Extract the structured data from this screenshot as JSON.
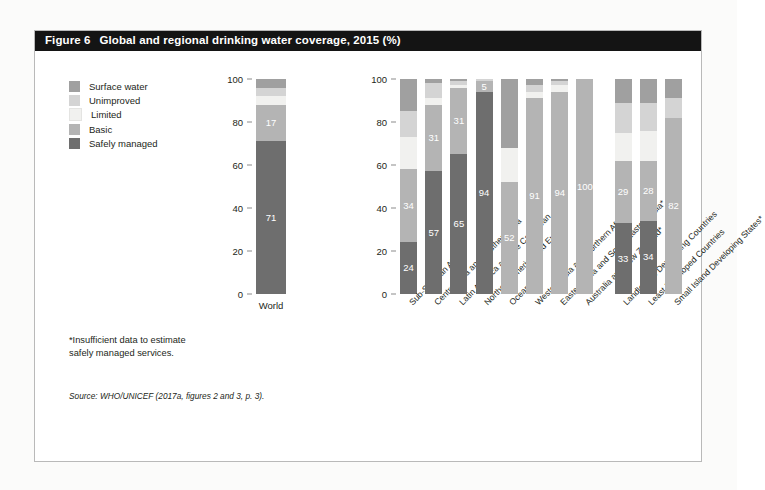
{
  "figure": {
    "number": "Figure 6",
    "title": "Global and regional drinking water coverage, 2015 (%)",
    "footnote_line1": "*Insufficient data to estimate",
    "footnote_line2": "safely managed services.",
    "source": "Source: WHO/UNICEF (2017a, figures 2 and 3, p. 3)."
  },
  "colors": {
    "title_bar": "#141414",
    "title_text": "#ffffff",
    "surface_water": "#a0a0a0",
    "unimproved": "#d4d4d4",
    "limited": "#f1f1ef",
    "basic": "#b4b4b4",
    "safely_managed": "#6e6e6e",
    "frame": "#b9b9b9",
    "text": "#231f20"
  },
  "legend": {
    "items": [
      {
        "label": "Surface water",
        "key": "surface_water",
        "color": "#a0a0a0"
      },
      {
        "label": "Unimproved",
        "key": "unimproved",
        "color": "#d4d4d4"
      },
      {
        "label": "Limited",
        "key": "limited",
        "color": "#f1f1ef"
      },
      {
        "label": "Basic",
        "key": "basic",
        "color": "#b4b4b4"
      },
      {
        "label": "Safely managed",
        "key": "safely_managed",
        "color": "#6e6e6e"
      }
    ]
  },
  "chart_data": {
    "type": "bar",
    "subtype": "stacked",
    "title": "Global and regional drinking water coverage, 2015 (%)",
    "xlabel": "",
    "ylabel": "",
    "ylim": [
      0,
      100
    ],
    "yticks": [
      0,
      20,
      40,
      60,
      80,
      100
    ],
    "grid": false,
    "legend_position": "top-left",
    "stack_order_bottom_to_top": [
      "Safely managed",
      "Basic",
      "Limited",
      "Unimproved",
      "Surface water"
    ],
    "series": [
      {
        "name": "Safely managed",
        "color": "#6e6e6e"
      },
      {
        "name": "Basic",
        "color": "#b4b4b4"
      },
      {
        "name": "Limited",
        "color": "#f1f1ef"
      },
      {
        "name": "Unimproved",
        "color": "#d4d4d4"
      },
      {
        "name": "Surface water",
        "color": "#a0a0a0"
      }
    ],
    "panels": [
      {
        "id": "global",
        "categories": [
          "World"
        ],
        "label_rotated": false,
        "bars": [
          {
            "category": "World",
            "segments": [
              {
                "series": "Safely managed",
                "value": 71,
                "label": "71"
              },
              {
                "series": "Basic",
                "value": 17,
                "label": "17"
              },
              {
                "series": "Limited",
                "value": 4,
                "label": ""
              },
              {
                "series": "Unimproved",
                "value": 4,
                "label": ""
              },
              {
                "series": "Surface water",
                "value": 4,
                "label": ""
              }
            ]
          }
        ]
      },
      {
        "id": "regional",
        "label_rotated": true,
        "categories": [
          "Sub-Saharan Africa",
          "Central Asia and Southern Asia",
          "Latin America and the Caribbean",
          "Northern America and Europe",
          "Oceania*",
          "Western Asia and Northern Africa*",
          "Eastern Asia and South-Eastern Asia*",
          "Australia and New Zealand*",
          "Landlocked Developing Countries",
          "Least Developed Countries",
          "Small Island Developing States*"
        ],
        "bars": [
          {
            "category": "Sub-Saharan Africa",
            "segments": [
              {
                "series": "Safely managed",
                "value": 24,
                "label": "24"
              },
              {
                "series": "Basic",
                "value": 34,
                "label": "34"
              },
              {
                "series": "Limited",
                "value": 15,
                "label": ""
              },
              {
                "series": "Unimproved",
                "value": 12,
                "label": ""
              },
              {
                "series": "Surface water",
                "value": 15,
                "label": ""
              }
            ]
          },
          {
            "category": "Central Asia and Southern Asia",
            "segments": [
              {
                "series": "Safely managed",
                "value": 57,
                "label": "57"
              },
              {
                "series": "Basic",
                "value": 31,
                "label": "31"
              },
              {
                "series": "Limited",
                "value": 3,
                "label": ""
              },
              {
                "series": "Unimproved",
                "value": 7,
                "label": ""
              },
              {
                "series": "Surface water",
                "value": 2,
                "label": ""
              }
            ]
          },
          {
            "category": "Latin America and the Caribbean",
            "segments": [
              {
                "series": "Safely managed",
                "value": 65,
                "label": "65"
              },
              {
                "series": "Basic",
                "value": 31,
                "label": "31"
              },
              {
                "series": "Limited",
                "value": 1,
                "label": ""
              },
              {
                "series": "Unimproved",
                "value": 2,
                "label": ""
              },
              {
                "series": "Surface water",
                "value": 1,
                "label": ""
              }
            ]
          },
          {
            "category": "Northern America and Europe",
            "segments": [
              {
                "series": "Safely managed",
                "value": 94,
                "label": "94"
              },
              {
                "series": "Basic",
                "value": 5,
                "label": "5"
              },
              {
                "series": "Limited",
                "value": 0,
                "label": ""
              },
              {
                "series": "Unimproved",
                "value": 1,
                "label": ""
              },
              {
                "series": "Surface water",
                "value": 0,
                "label": ""
              }
            ]
          },
          {
            "category": "Oceania*",
            "segments": [
              {
                "series": "Safely managed",
                "value": 0,
                "label": ""
              },
              {
                "series": "Basic",
                "value": 52,
                "label": "52"
              },
              {
                "series": "Limited",
                "value": 16,
                "label": ""
              },
              {
                "series": "Unimproved",
                "value": 0,
                "label": ""
              },
              {
                "series": "Surface water",
                "value": 32,
                "label": ""
              }
            ]
          },
          {
            "category": "Western Asia and Northern Africa*",
            "segments": [
              {
                "series": "Safely managed",
                "value": 0,
                "label": ""
              },
              {
                "series": "Basic",
                "value": 91,
                "label": "91"
              },
              {
                "series": "Limited",
                "value": 3,
                "label": ""
              },
              {
                "series": "Unimproved",
                "value": 3,
                "label": ""
              },
              {
                "series": "Surface water",
                "value": 3,
                "label": ""
              }
            ]
          },
          {
            "category": "Eastern Asia and South-Eastern Asia*",
            "segments": [
              {
                "series": "Safely managed",
                "value": 0,
                "label": ""
              },
              {
                "series": "Basic",
                "value": 94,
                "label": "94"
              },
              {
                "series": "Limited",
                "value": 3,
                "label": ""
              },
              {
                "series": "Unimproved",
                "value": 2,
                "label": ""
              },
              {
                "series": "Surface water",
                "value": 1,
                "label": ""
              }
            ]
          },
          {
            "category": "Australia and New Zealand*",
            "segments": [
              {
                "series": "Safely managed",
                "value": 0,
                "label": ""
              },
              {
                "series": "Basic",
                "value": 100,
                "label": "100"
              },
              {
                "series": "Limited",
                "value": 0,
                "label": ""
              },
              {
                "series": "Unimproved",
                "value": 0,
                "label": ""
              },
              {
                "series": "Surface water",
                "value": 0,
                "label": ""
              }
            ]
          },
          {
            "category": "Landlocked Developing Countries",
            "segments": [
              {
                "series": "Safely managed",
                "value": 33,
                "label": "33"
              },
              {
                "series": "Basic",
                "value": 29,
                "label": "29"
              },
              {
                "series": "Limited",
                "value": 13,
                "label": ""
              },
              {
                "series": "Unimproved",
                "value": 14,
                "label": ""
              },
              {
                "series": "Surface water",
                "value": 11,
                "label": ""
              }
            ]
          },
          {
            "category": "Least Developed Countries",
            "segments": [
              {
                "series": "Safely managed",
                "value": 34,
                "label": "34"
              },
              {
                "series": "Basic",
                "value": 28,
                "label": "28"
              },
              {
                "series": "Limited",
                "value": 14,
                "label": ""
              },
              {
                "series": "Unimproved",
                "value": 13,
                "label": ""
              },
              {
                "series": "Surface water",
                "value": 11,
                "label": ""
              }
            ]
          },
          {
            "category": "Small Island Developing States*",
            "segments": [
              {
                "series": "Safely managed",
                "value": 0,
                "label": ""
              },
              {
                "series": "Basic",
                "value": 82,
                "label": "82"
              },
              {
                "series": "Limited",
                "value": 0,
                "label": ""
              },
              {
                "series": "Unimproved",
                "value": 9,
                "label": ""
              },
              {
                "series": "Surface water",
                "value": 9,
                "label": ""
              }
            ]
          }
        ]
      }
    ]
  }
}
